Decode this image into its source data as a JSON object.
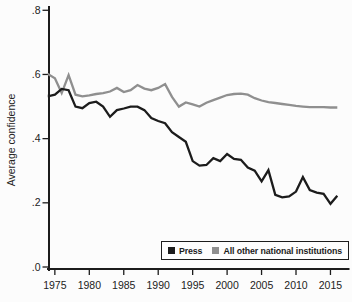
{
  "chart_data": {
    "type": "line",
    "title": "",
    "xlabel": "",
    "ylabel": "Average confidence",
    "xlim": [
      1974.15,
      2017.6
    ],
    "ylim": [
      0.0,
      0.8
    ],
    "grid": false,
    "y_ticks": [
      {
        "label": ".8",
        "value": 0.8
      },
      {
        "label": ".6",
        "value": 0.6
      },
      {
        "label": ".4",
        "value": 0.4
      },
      {
        "label": ".2",
        "value": 0.2
      },
      {
        "label": ".0",
        "value": 0.0
      }
    ],
    "x_ticks": [
      {
        "label": "1975",
        "value": 1975
      },
      {
        "label": "1980",
        "value": 1980
      },
      {
        "label": "1985",
        "value": 1985
      },
      {
        "label": "1990",
        "value": 1990
      },
      {
        "label": "1995",
        "value": 1995
      },
      {
        "label": "2000",
        "value": 2000
      },
      {
        "label": "2005",
        "value": 2005
      },
      {
        "label": "2010",
        "value": 2010
      },
      {
        "label": "2015",
        "value": 2015
      }
    ],
    "legend": {
      "position": "inside-bottom-right",
      "entries": [
        {
          "label": "Press",
          "color": "#1c1c1c"
        },
        {
          "label": "All other national institutions",
          "color": "#8f8f8f"
        }
      ]
    },
    "series": [
      {
        "name": "Press",
        "color": "#1c1c1c",
        "points": [
          [
            1973,
            0.545
          ],
          [
            1974,
            0.532
          ],
          [
            1975,
            0.537
          ],
          [
            1976,
            0.555
          ],
          [
            1977,
            0.551
          ],
          [
            1978,
            0.5
          ],
          [
            1979,
            0.495
          ],
          [
            1980,
            0.511
          ],
          [
            1981,
            0.515
          ],
          [
            1982,
            0.5
          ],
          [
            1983,
            0.468
          ],
          [
            1984,
            0.489
          ],
          [
            1985,
            0.494
          ],
          [
            1986,
            0.5
          ],
          [
            1987,
            0.5
          ],
          [
            1988,
            0.489
          ],
          [
            1989,
            0.464
          ],
          [
            1990,
            0.455
          ],
          [
            1991,
            0.448
          ],
          [
            1992,
            0.42
          ],
          [
            1993,
            0.405
          ],
          [
            1994,
            0.39
          ],
          [
            1995,
            0.33
          ],
          [
            1996,
            0.316
          ],
          [
            1997,
            0.318
          ],
          [
            1998,
            0.339
          ],
          [
            1999,
            0.33
          ],
          [
            2000,
            0.352
          ],
          [
            2001,
            0.337
          ],
          [
            2002,
            0.334
          ],
          [
            2003,
            0.31
          ],
          [
            2004,
            0.3
          ],
          [
            2005,
            0.267
          ],
          [
            2006,
            0.302
          ],
          [
            2007,
            0.225
          ],
          [
            2008,
            0.217
          ],
          [
            2009,
            0.22
          ],
          [
            2010,
            0.235
          ],
          [
            2011,
            0.28
          ],
          [
            2012,
            0.24
          ],
          [
            2013,
            0.232
          ],
          [
            2014,
            0.228
          ],
          [
            2015,
            0.197
          ],
          [
            2016,
            0.222
          ]
        ]
      },
      {
        "name": "All other national institutions",
        "color": "#8f8f8f",
        "points": [
          [
            1973,
            0.605
          ],
          [
            1974,
            0.601
          ],
          [
            1975,
            0.588
          ],
          [
            1976,
            0.542
          ],
          [
            1977,
            0.598
          ],
          [
            1978,
            0.537
          ],
          [
            1979,
            0.532
          ],
          [
            1980,
            0.535
          ],
          [
            1981,
            0.539
          ],
          [
            1982,
            0.542
          ],
          [
            1983,
            0.547
          ],
          [
            1984,
            0.558
          ],
          [
            1985,
            0.545
          ],
          [
            1986,
            0.551
          ],
          [
            1987,
            0.567
          ],
          [
            1988,
            0.556
          ],
          [
            1989,
            0.551
          ],
          [
            1990,
            0.558
          ],
          [
            1991,
            0.57
          ],
          [
            1992,
            0.53
          ],
          [
            1993,
            0.5
          ],
          [
            1994,
            0.513
          ],
          [
            1995,
            0.507
          ],
          [
            1996,
            0.5
          ],
          [
            1997,
            0.512
          ],
          [
            1998,
            0.52
          ],
          [
            1999,
            0.528
          ],
          [
            2000,
            0.536
          ],
          [
            2001,
            0.539
          ],
          [
            2002,
            0.54
          ],
          [
            2003,
            0.537
          ],
          [
            2004,
            0.526
          ],
          [
            2005,
            0.519
          ],
          [
            2006,
            0.514
          ],
          [
            2007,
            0.511
          ],
          [
            2008,
            0.508
          ],
          [
            2009,
            0.505
          ],
          [
            2010,
            0.502
          ],
          [
            2011,
            0.5
          ],
          [
            2012,
            0.498
          ],
          [
            2013,
            0.498
          ],
          [
            2014,
            0.498
          ],
          [
            2015,
            0.497
          ],
          [
            2016,
            0.497
          ]
        ]
      }
    ]
  }
}
